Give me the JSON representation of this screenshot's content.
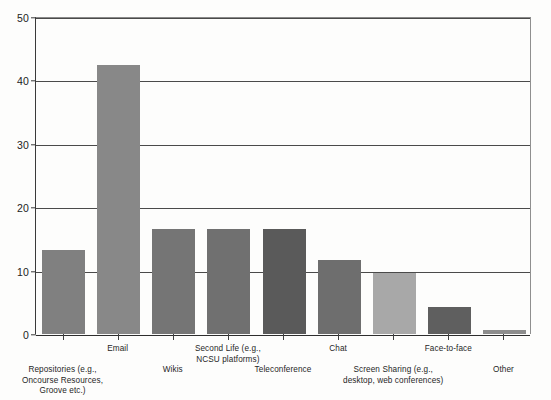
{
  "chart_data": {
    "type": "bar",
    "title": "",
    "subtitle": "",
    "xlabel": "",
    "ylabel": "",
    "ylim": [
      0,
      50
    ],
    "ytick_values": [
      0,
      10,
      20,
      30,
      40,
      50
    ],
    "ytick_labels": [
      "0",
      "10",
      "20",
      "30",
      "40",
      "50"
    ],
    "grid": true,
    "grid_axis": "y",
    "legend": false,
    "categories": [
      "Repositories (e.g.,\nOncourse Resources,\nGroove etc.)",
      "Email",
      "Wikis",
      "Second Life (e.g.,\nNCSU platforms)",
      "Teleconference",
      "Chat",
      "Screen Sharing (e.g.,\ndesktop, web conferences)",
      "Face-to-face",
      "Other"
    ],
    "values": [
      13.2,
      42.5,
      16.6,
      16.6,
      16.6,
      11.7,
      9.7,
      4.2,
      0.6
    ],
    "bar_colors": [
      "#808080",
      "#888888",
      "#757575",
      "#707070",
      "#5a5a5a",
      "#6e6e6e",
      "#a8a8a8",
      "#5f5f5f",
      "#8d8d8d"
    ],
    "axis_color": "#2d2d2d",
    "grid_color": "#4a4a4a",
    "background_color": "#fdfdfc"
  },
  "axis": {
    "y_ticks": [
      {
        "label": "50",
        "value": 50
      },
      {
        "label": "40",
        "value": 40
      },
      {
        "label": "30",
        "value": 30
      },
      {
        "label": "20",
        "value": 20
      },
      {
        "label": "10",
        "value": 10
      },
      {
        "label": "0",
        "value": 0
      }
    ]
  },
  "x_categories": [
    {
      "label": "Repositories (e.g.,\nOncourse Resources,\nGroove etc.)",
      "row": "lower"
    },
    {
      "label": "Email",
      "row": "upper"
    },
    {
      "label": "Wikis",
      "row": "lower"
    },
    {
      "label": "Second Life (e.g.,\nNCSU platforms)",
      "row": "upper"
    },
    {
      "label": "Teleconference",
      "row": "lower"
    },
    {
      "label": "Chat",
      "row": "upper"
    },
    {
      "label": "Screen Sharing (e.g.,\ndesktop, web conferences)",
      "row": "lower"
    },
    {
      "label": "Face-to-face",
      "row": "upper"
    },
    {
      "label": "Other",
      "row": "lower"
    }
  ]
}
